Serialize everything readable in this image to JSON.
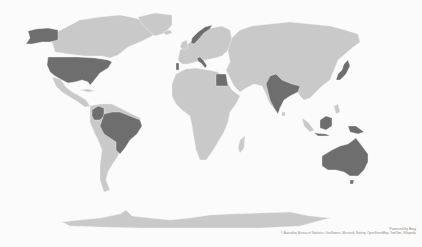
{
  "map": {
    "provider_label": "Powered by Bing",
    "copyright": "© Australian Bureau of Statistics, GeoNames, Microsoft, Navteq, OpenStreetMap, TomTom, Wikipedia",
    "colors": {
      "background": "#fbfbfb",
      "land_default": "#c9c9c9",
      "land_highlighted": "#6e6e6e"
    },
    "highlighted_countries": [
      "United States",
      "Brazil",
      "Colombia",
      "Norway",
      "Italy",
      "Portugal",
      "Egypt",
      "India",
      "Japan",
      "Indonesia",
      "Malaysia",
      "Papua New Guinea",
      "Australia"
    ]
  }
}
